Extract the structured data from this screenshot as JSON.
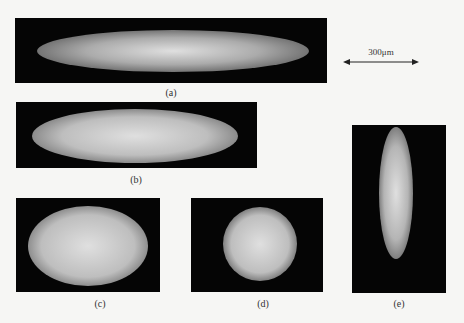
{
  "figure": {
    "scale_bar": {
      "label": "300μm",
      "color": "#222222"
    },
    "panels": [
      {
        "id": "a",
        "caption": "(a)",
        "shape": "elongated horizontal ellipse"
      },
      {
        "id": "b",
        "caption": "(b)",
        "shape": "horizontal ellipse"
      },
      {
        "id": "c",
        "caption": "(c)",
        "shape": "oval"
      },
      {
        "id": "d",
        "caption": "(d)",
        "shape": "circle"
      },
      {
        "id": "e",
        "caption": "(e)",
        "shape": "elongated vertical ellipse"
      }
    ],
    "colors": {
      "panel_background": "#050505",
      "speckle": "#e8e8e8",
      "page_background": "#f6f6f4"
    }
  }
}
